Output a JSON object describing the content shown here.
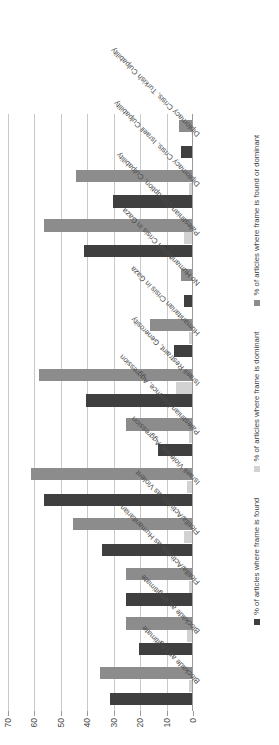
{
  "chart_data": {
    "type": "bar",
    "orientation": "vertical-rotated-90ccw",
    "title": "",
    "subtitle": "",
    "xlabel": "",
    "ylabel": "",
    "ylim": [
      0,
      70
    ],
    "yticks": [
      0,
      10,
      20,
      30,
      40,
      50,
      60,
      70
    ],
    "grid": true,
    "legend_position": "bottom",
    "categories": [
      "Blockade as Legitimate",
      "Blockade as Illegitimate",
      "Flotilla/Activists as Humanitarian",
      "Flotilla/Activists as Violent",
      "Israeli Violence, Aggression",
      "Palestinian Violence, Aggression",
      "Israeli Restraint, Generosity",
      "Humanitarian Crisis in Gaza",
      "No Humanitarian Crisis in Gaza",
      "Palestinian Corruption, Culpability",
      "Diplomacy Crisis, Israeli Culpability",
      "Diplomacy Crisis, Turkish Culpability"
    ],
    "series": [
      {
        "name": "% of articles where frame is found",
        "color": "#3f3f3f",
        "values": [
          31,
          20,
          25,
          34,
          56,
          13,
          40,
          7,
          3,
          41,
          30,
          4
        ]
      },
      {
        "name": "% of articles where frame is dominant",
        "color": "#d2d2d2",
        "values": [
          1,
          2,
          1,
          3,
          2,
          1,
          6,
          1,
          0,
          3,
          1,
          0
        ]
      },
      {
        "name": "% of articles where frame is found or dominant",
        "color": "#8c8c8c",
        "values": [
          35,
          25,
          25,
          45,
          61,
          25,
          58,
          16,
          4,
          56,
          44,
          5
        ]
      }
    ]
  },
  "axis": {
    "tick_labels": [
      "0",
      "10",
      "20",
      "30",
      "40",
      "50",
      "60",
      "70"
    ]
  },
  "legend": {
    "items": [
      {
        "label": "% of articles where frame is found",
        "color": "#3f3f3f",
        "swatch": "square-dark"
      },
      {
        "label": "% of articles where frame is dominant",
        "color": "#d2d2d2",
        "swatch": "square-light"
      },
      {
        "label": "% of articles where frame is found or dominant",
        "color": "#8c8c8c",
        "swatch": "square-mid"
      }
    ]
  }
}
